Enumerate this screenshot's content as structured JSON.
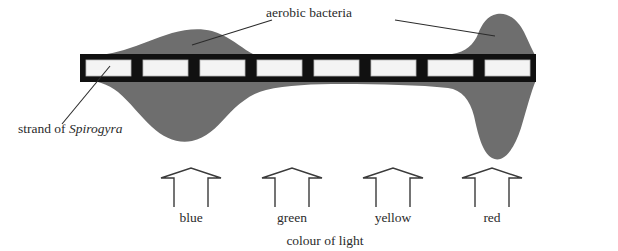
{
  "diagram": {
    "title_implied": "Engelmann's experiment with Spirogyra and aerobic bacteria",
    "labels": {
      "aerobic_bacteria": "aerobic bacteria",
      "strand_prefix": "strand of ",
      "strand_organism": "Spirogyra",
      "colour_of_light": "colour of light"
    },
    "light_arrows": [
      {
        "label": "blue",
        "cx": 191
      },
      {
        "label": "green",
        "cx": 292
      },
      {
        "label": "yellow",
        "cx": 393
      },
      {
        "label": "red",
        "cx": 492
      }
    ],
    "filament": {
      "cell_count": 8,
      "x_start": 80,
      "x_end": 536,
      "y_top": 54,
      "y_bottom": 82
    },
    "colors": {
      "bacteria_gray": "#6e6e6e",
      "cell_wall": "#111111",
      "cell_interior": "#f2f2f2",
      "ink": "#2b2b2b",
      "background": "#ffffff"
    },
    "bacteria_density": {
      "note": "bacteria accumulate where oxygen is released; densest at blue and red light",
      "regions": [
        {
          "light": "blue",
          "density": "high"
        },
        {
          "light": "green",
          "density": "low"
        },
        {
          "light": "yellow",
          "density": "low"
        },
        {
          "light": "red",
          "density": "very high"
        }
      ]
    }
  }
}
